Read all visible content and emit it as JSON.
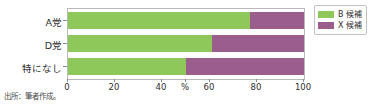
{
  "chart_data": {
    "type": "bar",
    "orientation": "horizontal",
    "stacked": true,
    "title": "",
    "subtitle": "",
    "xlabel": "%",
    "ylabel": "",
    "xlim": [
      0,
      100
    ],
    "grid": false,
    "legend_position": "top-right",
    "categories": [
      "A党",
      "D党",
      "特になし"
    ],
    "xticks": [
      {
        "value": 0,
        "label": "0"
      },
      {
        "value": 20,
        "label": "20"
      },
      {
        "value": 40,
        "label": "40"
      },
      {
        "value": 50,
        "label": "%"
      },
      {
        "value": 60,
        "label": "60"
      },
      {
        "value": 80,
        "label": "80"
      },
      {
        "value": 100,
        "label": "100"
      }
    ],
    "series": [
      {
        "name": "B 候補",
        "color": "#8ec85a",
        "values": [
          77,
          61,
          50
        ]
      },
      {
        "name": "X 候補",
        "color": "#9b5e8c",
        "values": [
          23,
          39,
          50
        ]
      }
    ],
    "annotations": []
  },
  "legend": {
    "entries": [
      {
        "label": "B 候補"
      },
      {
        "label": "X 候補"
      }
    ]
  },
  "source": {
    "note": "出所：筆者作成。"
  },
  "colors": {
    "series_b_candidate": "#8ec85a",
    "series_x_candidate": "#9b5e8c",
    "axis": "#b9b9b9",
    "text": "#2e2e2e",
    "background": "#ffffff"
  }
}
